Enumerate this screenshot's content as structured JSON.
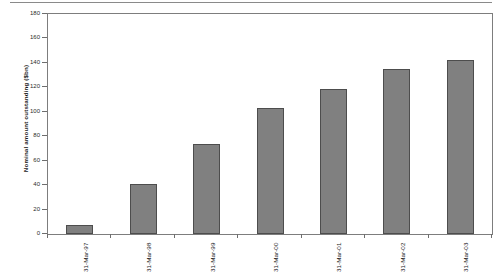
{
  "chart_data": {
    "type": "bar",
    "title": "",
    "subtitle": "",
    "xlabel": "",
    "ylabel": "Nominal amount outstanding ($bn)",
    "categories": [
      "31-Mar-97",
      "31-Mar-98",
      "31-Mar-99",
      "31-Mar-00",
      "31-Mar-01",
      "31-Mar-02",
      "31-Mar-03"
    ],
    "values": [
      7,
      41,
      74,
      103,
      119,
      135,
      142
    ],
    "series": [
      {
        "name": "Nominal amount outstanding",
        "values": [
          7,
          41,
          74,
          103,
          119,
          135,
          142
        ]
      }
    ],
    "ylim": [
      0,
      180
    ],
    "ytick_labels": [
      "0",
      "20",
      "40",
      "60",
      "80",
      "100",
      "120",
      "140",
      "160",
      "180"
    ],
    "ytick_values": [
      0,
      20,
      40,
      60,
      80,
      100,
      120,
      140,
      160,
      180
    ],
    "grid": false,
    "legend": false,
    "legend_position": "none",
    "bar_color": "#808080",
    "bar_edge_color": "#4d4d4d",
    "axis_color": "#7d7d7d",
    "background_color": "#ffffff",
    "annotations": []
  }
}
